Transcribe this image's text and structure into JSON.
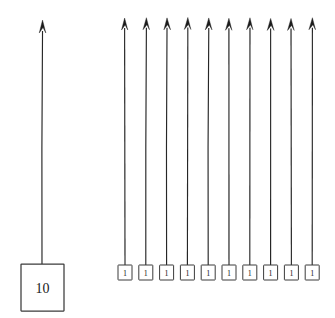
{
  "figure": {
    "title": "",
    "background_color": "#ffffff",
    "ink_color": "#262626",
    "box_stroke_color": "#3b3b3b",
    "width": 335,
    "height": 318
  },
  "left_group": {
    "name": "single-large-node",
    "node": {
      "label": "10",
      "x": 21,
      "y": 264,
      "width": 43,
      "height": 47
    },
    "arrow": {
      "x": 42,
      "y_bottom": 264,
      "y_top": 20,
      "direction": "up",
      "head_width": 7,
      "head_height": 13
    }
  },
  "right_group": {
    "name": "ten-small-nodes",
    "count": 10,
    "node_width": 14,
    "node_height": 15,
    "node_y": 265,
    "first_center_x": 125,
    "pitch": 20.8,
    "arrow_top_y": 18,
    "head_width": 6.5,
    "head_height": 12,
    "nodes": [
      {
        "label": "1",
        "center_x": 125
      },
      {
        "label": "1",
        "center_x": 145.8
      },
      {
        "label": "1",
        "center_x": 166.6
      },
      {
        "label": "1",
        "center_x": 187.4
      },
      {
        "label": "1",
        "center_x": 208.2
      },
      {
        "label": "1",
        "center_x": 229.0
      },
      {
        "label": "1",
        "center_x": 249.8
      },
      {
        "label": "1",
        "center_x": 270.6
      },
      {
        "label": "1",
        "center_x": 291.4
      },
      {
        "label": "1",
        "center_x": 312.2
      }
    ]
  }
}
